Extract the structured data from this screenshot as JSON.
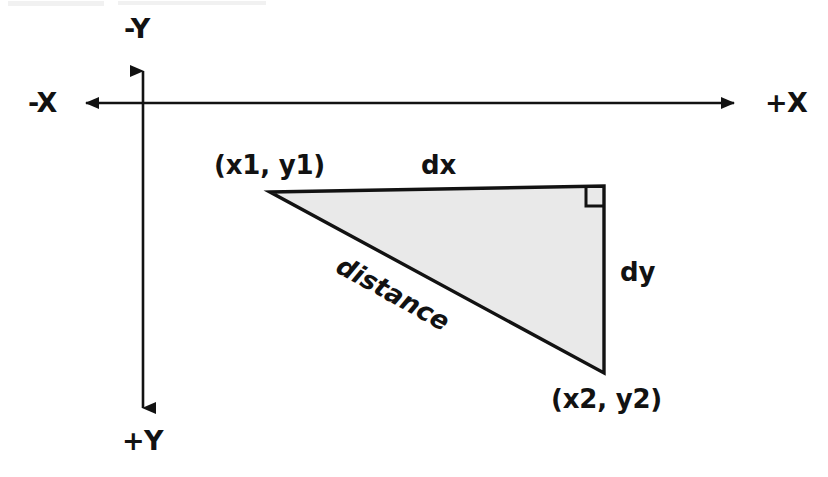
{
  "figure": {
    "background_color": "#ffffff",
    "stroke_color": "#121212",
    "triangle_fill": "#e9e9e9"
  },
  "axes": {
    "negative_x_label": "-X",
    "positive_x_label": "+X",
    "negative_y_label": "-Y",
    "positive_y_label": "+Y",
    "origin": {
      "x": 143,
      "y": 103
    },
    "horizontal": {
      "from_x": 72,
      "to_x": 748,
      "y": 103,
      "arrows": "both"
    },
    "vertical": {
      "x": 143,
      "from_y": 57,
      "to_y": 422,
      "arrows": "both"
    }
  },
  "triangle": {
    "vertices": {
      "p1": {
        "x": 270,
        "y": 192,
        "label": "(x1, y1)"
      },
      "corner": {
        "x": 604,
        "y": 186
      },
      "p2": {
        "x": 604,
        "y": 373,
        "label": "(x2, y2)"
      }
    },
    "right_angle_marker": {
      "size": 18,
      "at": "corner"
    },
    "edges": {
      "top_label": "dx",
      "right_label": "dy",
      "hypotenuse_label": "distance",
      "hypotenuse_angle_deg": 29
    }
  },
  "labels": {
    "p1": "(x1, y1)",
    "p2": "(x2, y2)",
    "dx": "dx",
    "dy": "dy",
    "distance": "distance",
    "neg_x": "-X",
    "pos_x": "+X",
    "neg_y": "-Y",
    "pos_y": "+Y"
  }
}
